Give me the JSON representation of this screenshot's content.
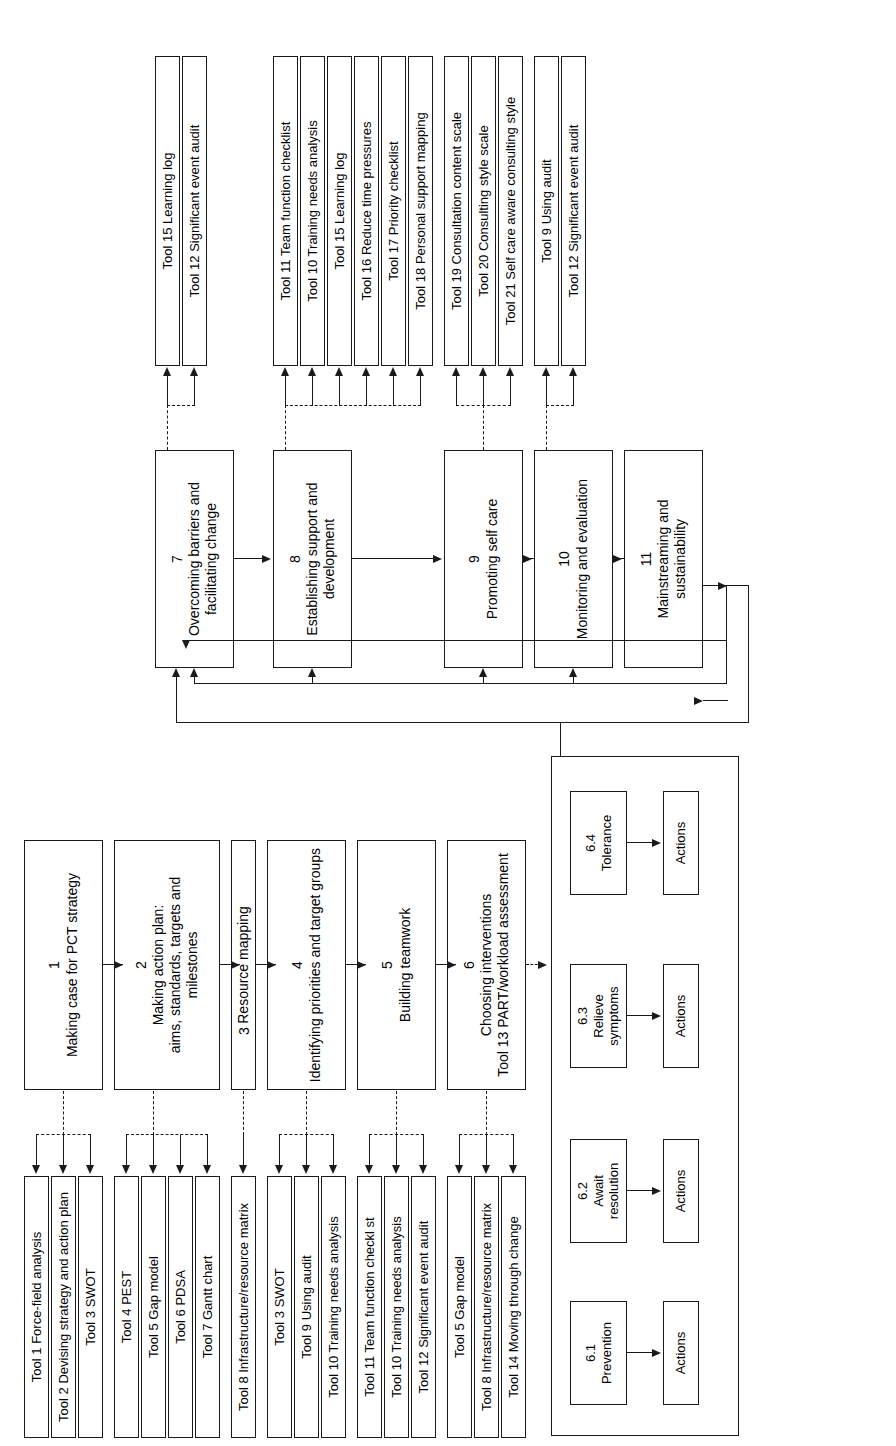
{
  "diagram": {
    "orientation": "rotated-90-ccw",
    "line_color": "#1a1a1a",
    "background": "#ffffff"
  },
  "steps": [
    {
      "num": "1",
      "label": "Making case for PCT strategy"
    },
    {
      "num": "2",
      "label": "Making action plan:\naims, standards, targets and milestones"
    },
    {
      "num": "3",
      "label": "Resource mapping"
    },
    {
      "num": "4",
      "label": "Identifying priorities and target groups"
    },
    {
      "num": "5",
      "label": "Building teamwork"
    },
    {
      "num": "6",
      "label": "Choosing interventions\nTool 13 PART/workload assessment"
    },
    {
      "num": "7",
      "label": "Overcoming barriers and\nfacilitating change"
    },
    {
      "num": "8",
      "label": "Establishing support and\ndevelopment"
    },
    {
      "num": "9",
      "label": "Promoting self care"
    },
    {
      "num": "10",
      "label": "Monitoring and evaluation"
    },
    {
      "num": "11",
      "label": "Mainstreaming and\nsustainability"
    }
  ],
  "substeps": [
    {
      "num": "6.1",
      "label": "Prevention",
      "action": "Actions"
    },
    {
      "num": "6.2",
      "label": "Await\nresolution",
      "action": "Actions"
    },
    {
      "num": "6.3",
      "label": "Relieve\nsymptoms",
      "action": "Actions"
    },
    {
      "num": "6.4",
      "label": "Tolerance",
      "action": "Actions"
    }
  ],
  "tool_groups": [
    {
      "for_step": "1",
      "tools": [
        "Tool 1 Force-field analysis",
        "Tool 2 Devising strategy and action plan",
        "Tool 3 SWOT"
      ]
    },
    {
      "for_step": "2",
      "tools": [
        "Tool 4 PEST",
        "Tool 5 Gap model",
        "Tool 6 PDSA",
        "Tool 7 Gantt chart"
      ]
    },
    {
      "for_step": "3",
      "tools": [
        "Tool 8 Infrastructure/resource matrix"
      ]
    },
    {
      "for_step": "4",
      "tools": [
        "Tool 3 SWOT",
        "Tool 9 Using audit",
        "Tool 10 Training needs analysis"
      ]
    },
    {
      "for_step": "5",
      "tools": [
        "Tool 11 Team function checkl st",
        "Tool 10 Training needs analysis",
        "Tool 12 Significant event audit"
      ]
    },
    {
      "for_step": "6",
      "tools": [
        "Tool 5 Gap model",
        "Tool 8 Infrastructure/resource matrix",
        "Tool 14 Moving through change"
      ]
    },
    {
      "for_step": "7",
      "tools": [
        "Tool 15 Learning log",
        "Tool 12 Significant event audit"
      ]
    },
    {
      "for_step": "8",
      "tools": [
        "Tool 11 Team function checklist",
        "Tool 10 Training needs analysis",
        "Tool 15 Learning log",
        "Tool 16 Reduce time pressures",
        "Tool 17 Priority checklist",
        "Tool 18 Personal support mapping"
      ]
    },
    {
      "for_step": "9",
      "tools": [
        "Tool 19 Consultation content scale",
        "Tool 20 Consulting style scale",
        "Tool 21 Self care aware consulting style"
      ]
    },
    {
      "for_step": "10",
      "tools": [
        "Tool 9 Using audit",
        "Tool 12 Significant event audit"
      ]
    }
  ]
}
